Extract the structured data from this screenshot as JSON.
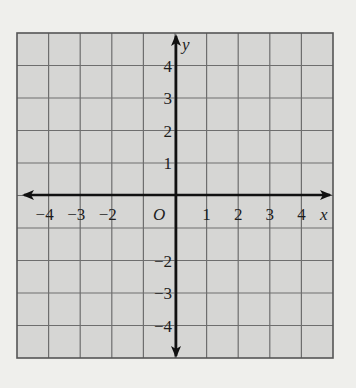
{
  "figure": {
    "type": "coordinate-plane",
    "grid": {
      "x_min": -5,
      "x_max": 5,
      "y_min": -5,
      "y_max": 5,
      "cols": 10,
      "rows": 10,
      "cell_fill": "#d6d6d4",
      "grid_line_color": "#6e6e6e",
      "axis_color": "#111111",
      "page_background": "#efefec"
    },
    "axes": {
      "x_label": "x",
      "y_label": "y",
      "origin_label": "O"
    },
    "x_ticks": [
      {
        "value": -4,
        "label": "−4"
      },
      {
        "value": -3,
        "label": "−3"
      },
      {
        "value": -2,
        "label": "−2"
      },
      {
        "value": 1,
        "label": "1"
      },
      {
        "value": 2,
        "label": "2"
      },
      {
        "value": 3,
        "label": "3"
      },
      {
        "value": 4,
        "label": "4"
      }
    ],
    "y_ticks": [
      {
        "value": 4,
        "label": "4"
      },
      {
        "value": 3,
        "label": "3"
      },
      {
        "value": 2,
        "label": "2"
      },
      {
        "value": 1,
        "label": "1"
      },
      {
        "value": -2,
        "label": "−2"
      },
      {
        "value": -3,
        "label": "−3"
      },
      {
        "value": -4,
        "label": "−4"
      }
    ]
  }
}
